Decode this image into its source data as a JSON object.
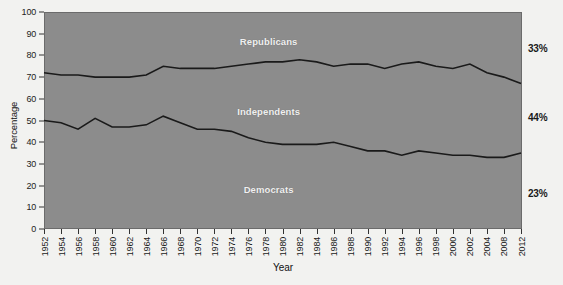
{
  "chart_data": {
    "type": "line",
    "title": "",
    "xlabel": "Year",
    "ylabel": "Percentage",
    "ylim": [
      0,
      100
    ],
    "ytick_values": [
      0,
      10,
      20,
      30,
      40,
      50,
      60,
      70,
      80,
      90,
      100
    ],
    "grid": false,
    "legend_position": "inline-annotations",
    "plot_background_color": "#8c8c8c",
    "line_color": "#1a1a1a",
    "inline_label_color": "#f0f0f0",
    "categories": [
      "1952",
      "1954",
      "1956",
      "1958",
      "1960",
      "1962",
      "1964",
      "1966",
      "1968",
      "1970",
      "1972",
      "1974",
      "1976",
      "1978",
      "1980",
      "1982",
      "1984",
      "1986",
      "1988",
      "1990",
      "1992",
      "1994",
      "1996",
      "1998",
      "2000",
      "2002",
      "2004",
      "2008",
      "2012"
    ],
    "xtick_labels": [
      "1952",
      "1954",
      "1956",
      "1958",
      "1960",
      "1962",
      "1964",
      "1966",
      "1968",
      "1970",
      "1972",
      "1974",
      "1976",
      "1978",
      "1980",
      "1982",
      "1984",
      "1986",
      "1988",
      "1990",
      "1992",
      "1994",
      "1996",
      "1998",
      "2000",
      "2002",
      "2004",
      "2008",
      "2012"
    ],
    "series": [
      {
        "name": "Republicans-boundary",
        "description": "Upper cumulative boundary: top of Independents band / bottom of Republicans band",
        "values": [
          72,
          71,
          71,
          70,
          70,
          70,
          71,
          75,
          74,
          74,
          74,
          75,
          76,
          77,
          77,
          78,
          77,
          75,
          76,
          76,
          74,
          76,
          77,
          75,
          74,
          76,
          72,
          70,
          67
        ]
      },
      {
        "name": "Democrats-boundary",
        "description": "Lower cumulative boundary: top of Democrats band / bottom of Independents band",
        "values": [
          50,
          49,
          46,
          51,
          47,
          47,
          48,
          52,
          49,
          46,
          46,
          45,
          42,
          40,
          39,
          39,
          39,
          40,
          38,
          36,
          36,
          34,
          36,
          35,
          34,
          34,
          33,
          33,
          35
        ]
      }
    ],
    "inline_labels": [
      {
        "text": "Republicans",
        "approx_value": 86
      },
      {
        "text": "Independents",
        "approx_value": 54
      },
      {
        "text": "Democrats",
        "approx_value": 18
      }
    ],
    "right_annotations": [
      {
        "text": "33%",
        "series": "Republicans",
        "y_value": 83
      },
      {
        "text": "44%",
        "series": "Independents",
        "y_value": 51
      },
      {
        "text": "23%",
        "series": "Democrats",
        "y_value": 16
      }
    ]
  }
}
